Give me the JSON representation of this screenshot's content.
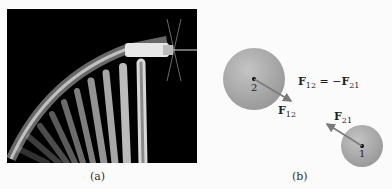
{
  "panel_a": {
    "caption": "(a)",
    "description": "stroboscopic photo of a hammer swinging and striking a nail"
  },
  "panel_b": {
    "caption": "(b)",
    "sphere_2_label": "2",
    "sphere_1_label": "1",
    "force_12_label": "F",
    "force_12_sub": "12",
    "force_21_label": "F",
    "force_21_sub": "21",
    "equation": {
      "lhs": "F",
      "lhs_sub": "12",
      "op": " = −",
      "rhs": "F",
      "rhs_sub": "21"
    }
  },
  "colors": {
    "photo_bg": "#000000",
    "sphere": "#a8a8a8",
    "arrow": "#7a7a7a",
    "page_bg": "#fbfbfb"
  }
}
